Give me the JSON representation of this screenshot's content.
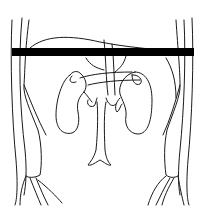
{
  "figure": {
    "structures": [
      "body-wall-left",
      "body-wall-right",
      "liver-outline",
      "kidney-left",
      "kidney-right",
      "spine",
      "ureter-left",
      "ureter-right",
      "pelvis-left",
      "pelvis-right"
    ],
    "marker": {
      "type": "horizontal-bar",
      "color": "#000000",
      "x_start": 12,
      "x_end": 194,
      "y": 48,
      "height": 8
    },
    "colors": {
      "line": "#1a1a1a",
      "background": "#ffffff"
    }
  }
}
